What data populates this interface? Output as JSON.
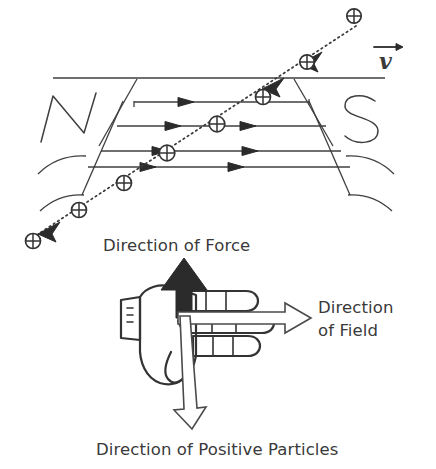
{
  "figure": {
    "background_color": "#ffffff",
    "ink_color": "#333333"
  },
  "magnet": {
    "north_pole_label": "N",
    "south_pole_label": "S",
    "field_line_count": 4,
    "field_direction": "left-to-right (N to S)"
  },
  "velocity": {
    "symbol": "v",
    "description": "velocity vector of incoming positive particles"
  },
  "particles": {
    "symbol": "⊕",
    "charge": "positive",
    "count": 7,
    "path": "diagonal from upper-right to lower-left"
  },
  "hand": {
    "force_label": "Direction of Force",
    "field_label_line1": "Direction",
    "field_label_line2": "of Field",
    "current_label": "Direction of Positive Particles",
    "force_arrow": "up",
    "field_arrow": "right",
    "current_arrow": "down"
  },
  "colors": {
    "ink": "#333333",
    "text": "#3a3a3a",
    "paper": "#ffffff",
    "solid_arrow": "#2b2b2b"
  }
}
